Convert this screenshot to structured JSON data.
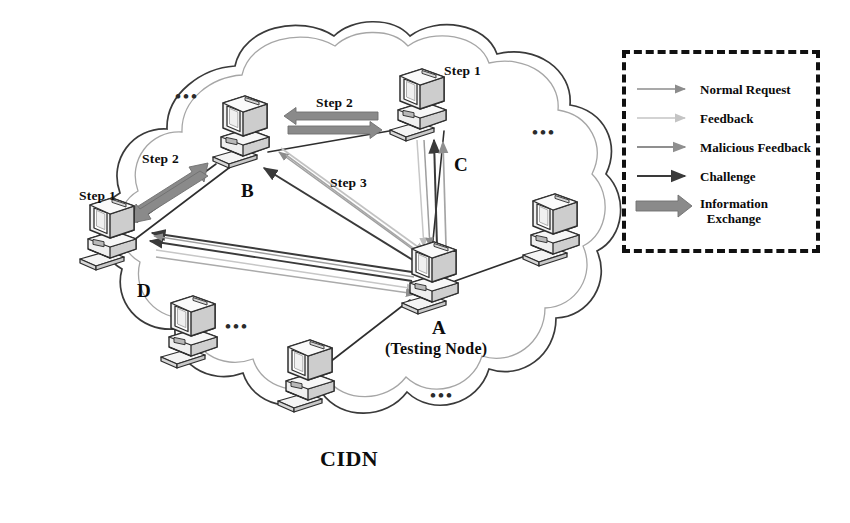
{
  "diagram": {
    "title": "CIDN",
    "network_label": "CIDN",
    "ellipsis": "•••"
  },
  "nodes": [
    {
      "id": "A",
      "label": "A",
      "sublabel": "(Testing Node)",
      "role": "testing-node",
      "x": 432,
      "y": 277
    },
    {
      "id": "B",
      "label": "B",
      "sublabel": "",
      "role": "peer",
      "x": 243,
      "y": 131
    },
    {
      "id": "C",
      "label": "C",
      "sublabel": "",
      "role": "peer",
      "x": 420,
      "y": 104
    },
    {
      "id": "D",
      "label": "D",
      "sublabel": "",
      "role": "peer",
      "x": 110,
      "y": 233
    },
    {
      "id": "E1",
      "label": "",
      "sublabel": "",
      "role": "anonymous-peer",
      "x": 553,
      "y": 229
    },
    {
      "id": "E2",
      "label": "",
      "sublabel": "",
      "role": "anonymous-peer",
      "x": 191,
      "y": 331
    },
    {
      "id": "E3",
      "label": "",
      "sublabel": "",
      "role": "anonymous-peer",
      "x": 308,
      "y": 375
    }
  ],
  "step_labels": [
    {
      "text": "Step 1",
      "x": 444,
      "y": 64,
      "for": "C"
    },
    {
      "text": "Step 2",
      "x": 316,
      "y": 96,
      "for": "B-C"
    },
    {
      "text": "Step 2",
      "x": 142,
      "y": 152,
      "for": "D-B"
    },
    {
      "text": "Step 1",
      "x": 79,
      "y": 189,
      "for": "D"
    },
    {
      "text": "Step 3",
      "x": 330,
      "y": 176,
      "for": "A-B"
    }
  ],
  "ellipsis_markers": [
    {
      "x": 175,
      "y": 88
    },
    {
      "x": 532,
      "y": 124
    },
    {
      "x": 225,
      "y": 318
    },
    {
      "x": 430,
      "y": 387
    }
  ],
  "legend": {
    "title": "",
    "border_style": "dashed",
    "border_color": "#111111",
    "items": [
      {
        "label": "Normal Request",
        "style": "thin",
        "color": "#8c8c8c",
        "line_width": 1.6,
        "head": "small"
      },
      {
        "label": "Feedback",
        "style": "thin-light",
        "color": "#bdbdbd",
        "line_width": 1.6,
        "head": "small"
      },
      {
        "label": "Malicious Feedback",
        "style": "thin",
        "color": "#8f8f8f",
        "line_width": 1.8,
        "head": "small"
      },
      {
        "label": "Challenge",
        "style": "solid-dark",
        "color": "#3a3a3a",
        "line_width": 2.0,
        "head": "small"
      },
      {
        "label": "Information\nExchange",
        "style": "block",
        "color": "#8a8a8a",
        "line_width": 9.0,
        "head": "large"
      }
    ]
  },
  "colors": {
    "background": "#ffffff",
    "cloud_stroke": "#3a3a3a",
    "cloud_stroke_light": "#9a9a9a",
    "computer_stroke": "#2e2e2e",
    "computer_fill": "#f2f2f2",
    "computer_shade": "#cccccc",
    "normal_request": "#8c8c8c",
    "feedback": "#bdbdbd",
    "malicious_feedback": "#8f8f8f",
    "challenge": "#3a3a3a",
    "information_exchange": "#8a8a8a",
    "link": "#2e2e2e",
    "text": "#0d0d0d"
  }
}
